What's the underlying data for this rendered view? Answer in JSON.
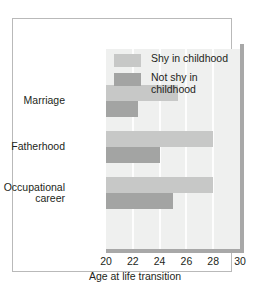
{
  "chart_data": {
    "type": "bar",
    "orientation": "horizontal",
    "title": "",
    "subtitle": "",
    "xlabel": "Age at life transition",
    "ylabel": "",
    "categories": [
      "Marriage",
      "Fatherhood",
      "Occupational\ncareer"
    ],
    "series": [
      {
        "name": "Shy in childhood",
        "color": "#c7c8c7",
        "values": [
          25.4,
          28.0,
          28.0
        ]
      },
      {
        "name": "Not shy in\nchildhood",
        "color": "#a3a4a3",
        "values": [
          22.4,
          24.0,
          25.0
        ]
      }
    ],
    "xlim": [
      20,
      30
    ],
    "xticks": [
      20,
      22,
      24,
      26,
      28,
      30
    ],
    "xtick_labels": [
      "20",
      "22",
      "24",
      "26",
      "28",
      "30"
    ],
    "grid": "vertical-white-gridlines",
    "legend_position": "top-left-inside-plot",
    "plot_background": "#eff0ef",
    "spine_color": "#a8a8a8",
    "frame_color": "#b9b9b9",
    "text_color": "#231f20"
  },
  "legend": {
    "entries": [
      {
        "label": "Shy in childhood",
        "color": "#c7c8c7"
      },
      {
        "label": "Not shy in\nchildhood",
        "color": "#a3a4a3"
      }
    ]
  },
  "axis": {
    "x_title": "Age at life transition",
    "tick_labels": [
      "20",
      "22",
      "24",
      "26",
      "28",
      "30"
    ]
  }
}
